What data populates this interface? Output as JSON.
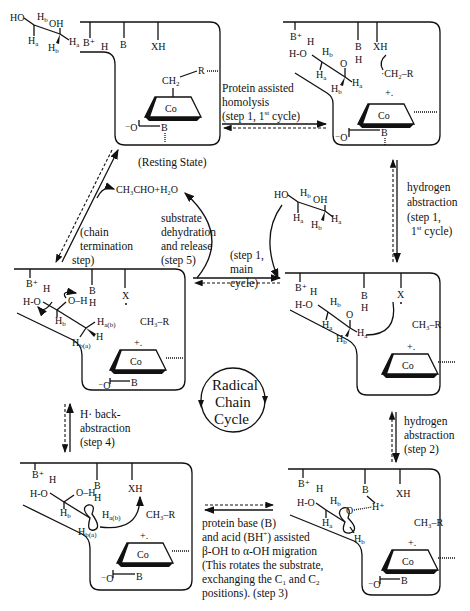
{
  "states": {
    "resting": {
      "caption": "(Resting State)",
      "substrate": {
        "ho": "HO",
        "oh": "OH",
        "ha": "H",
        "hb": "H",
        "sub_a": "a",
        "sub_b": "b"
      },
      "residues": [
        "B⁺",
        "H",
        "B",
        "XH"
      ],
      "cofactor": {
        "ch2": "CH",
        "ch2_sub": "2",
        "r": "R",
        "co": "Co",
        "o_minus": "⁻O",
        "b": "B"
      }
    },
    "homolysis": {
      "residues": [
        "B⁺",
        "H",
        "B",
        "H",
        "XH"
      ],
      "substrate": {
        "hoh": "H-O",
        "o": "O"
      },
      "radical": "·CH₂–R",
      "co": "Co",
      "charge": "+.",
      "o_minus": "⁻O",
      "b": "B"
    },
    "abstraction1": {
      "residues": [
        "B⁺",
        "H",
        "B",
        "H",
        "X"
      ],
      "substrate": {
        "hoh": "H-O",
        "o": "O"
      },
      "ch3r": "CH₃–R",
      "co": "Co",
      "charge": "+."
    },
    "termination": {
      "residues": [
        "B⁺",
        "H",
        "B",
        "H",
        "X"
      ],
      "substrate": {
        "hoh": "H-O",
        "oh": "O–H",
        "hab": "H",
        "hab_sub": "a(b)",
        "hba": "H",
        "hba_sub": "b(a)",
        "hb": "H",
        "h": "H"
      },
      "ch3r": "CH₃–R",
      "co": "Co",
      "charge": "+.",
      "o_minus": "⁻O",
      "b": "B"
    },
    "backabstraction": {
      "residues": [
        "B⁺",
        "H",
        "B",
        "H",
        "XH"
      ],
      "substrate": {
        "hoh": "H-O",
        "oh": "O–H",
        "hab": "H",
        "hab_sub": "a(b)",
        "hba": "H",
        "hba_sub": "b(a)",
        "hb": "H"
      },
      "ch3r": "CH₃–R",
      "co": "Co",
      "charge": "+.",
      "o_minus": "⁻O",
      "b": "B"
    },
    "migration": {
      "residues": [
        "B⁺",
        "H",
        "B",
        "XH"
      ],
      "substrate": {
        "hoh": "H-O",
        "o": "O",
        "hplus": "H⁺",
        "ha": "H",
        "hb": "H"
      },
      "ch3r": "CH₃–R",
      "co": "Co",
      "charge": "+.",
      "o_minus": "⁻O",
      "b": "B"
    }
  },
  "free_substrate": {
    "ho": "HO",
    "oh": "OH",
    "h": "H"
  },
  "product": "CH₃CHO+H₂O",
  "arrows": {
    "homolysis": [
      "Protein assisted",
      "homolysis",
      "(step 1, 1",
      "st",
      " cycle)"
    ],
    "h_abstraction_1": [
      "hydrogen",
      "abstraction",
      "(step 1,",
      "1",
      "st",
      " cycle)"
    ],
    "h_abstraction_2": [
      "hydrogen",
      "abstraction",
      "(step 2)"
    ],
    "step1_main": [
      "(step 1,",
      "main",
      "cycle)"
    ],
    "dehydration": [
      "substrate",
      "dehydration",
      "and release",
      "(step 5)"
    ],
    "termination": [
      "(chain",
      "termination",
      "step)"
    ],
    "back_abstraction": [
      "H·  back-",
      "abstraction",
      "(step 4)"
    ],
    "migration": [
      "protein base (B)",
      "and acid (BH",
      "+",
      ") assisted",
      "β-OH to α-OH migration",
      "(This rotates the substrate,",
      "exchanging the C",
      "1",
      " and C",
      "2",
      "positions).  (step 3)"
    ]
  },
  "cycle_label": [
    "Radical",
    "Chain",
    "Cycle"
  ]
}
